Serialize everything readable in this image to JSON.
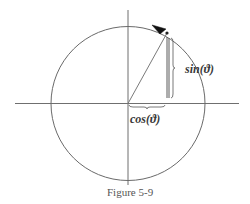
{
  "figure": {
    "caption": "Figure 5-9",
    "sin_label": "sin(ϑ)",
    "cos_label": "cos(ϑ)",
    "angle_degrees": 61,
    "colors": {
      "line": "#6f6f6f",
      "arrow": "#111111",
      "text": "#3a3a3a"
    }
  }
}
